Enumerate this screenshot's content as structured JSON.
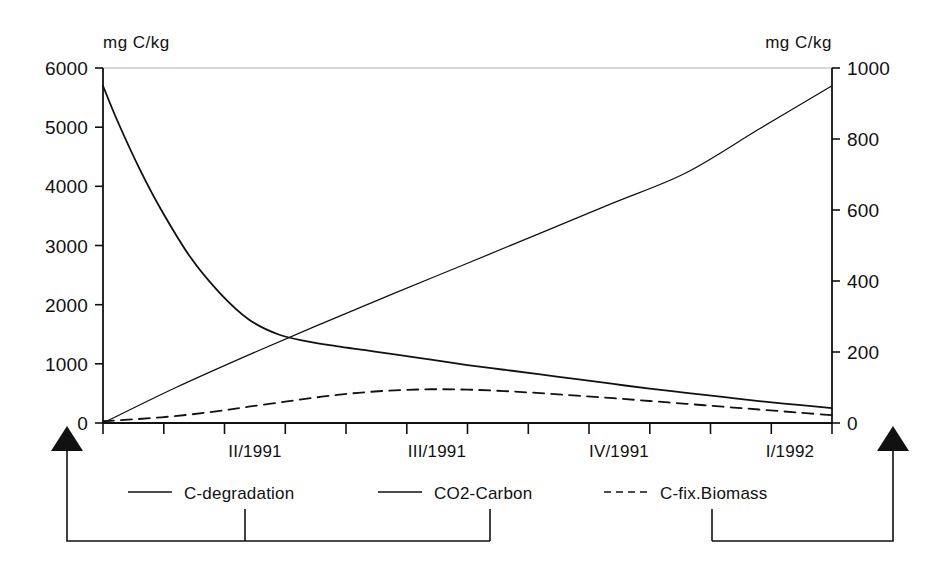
{
  "chart_data": {
    "type": "line",
    "title": "",
    "subtitle": "",
    "xlabel": "",
    "ylabel": "mg C/kg",
    "y2label": "mg C/kg",
    "grid": false,
    "legend_position": "bottom",
    "axes": {
      "left": {
        "unit": "mg C/kg",
        "ticks": [
          "0",
          "1000",
          "2000",
          "3000",
          "4000",
          "5000",
          "6000"
        ],
        "tick_values": [
          0,
          1000,
          2000,
          3000,
          4000,
          5000,
          6000
        ],
        "ylim": [
          0,
          6000
        ]
      },
      "right": {
        "unit": "mg C/kg",
        "ticks": [
          "0",
          "200",
          "400",
          "600",
          "800",
          "1000"
        ],
        "tick_values": [
          0,
          200,
          400,
          600,
          800,
          1000
        ],
        "ylim": [
          0,
          1000
        ]
      },
      "x": {
        "tick_labels": [
          "II/1991",
          "III/1991",
          "IV/1991",
          "I/1992"
        ],
        "tick_label_positions": [
          0.25,
          0.5,
          0.75,
          0.95
        ],
        "minor_tick_count": 11
      }
    },
    "series": [
      {
        "name": "C-degradation",
        "axis": "left",
        "style": "solid",
        "x": [
          0.0,
          0.02,
          0.05,
          0.08,
          0.12,
          0.16,
          0.2,
          0.24,
          0.28,
          0.32,
          0.36,
          0.4,
          0.45,
          0.5,
          0.55,
          0.6,
          0.65,
          0.7,
          0.75,
          0.8,
          0.85,
          0.9,
          0.95,
          1.0
        ],
        "values": [
          5700,
          5100,
          4300,
          3600,
          2800,
          2200,
          1750,
          1500,
          1380,
          1300,
          1230,
          1160,
          1070,
          980,
          900,
          820,
          740,
          660,
          580,
          510,
          440,
          370,
          310,
          250
        ]
      },
      {
        "name": "CO2-Carbon",
        "axis": "right",
        "style": "solid",
        "x": [
          0.0,
          0.1,
          0.2,
          0.3,
          0.4,
          0.5,
          0.6,
          0.7,
          0.8,
          0.9,
          1.0
        ],
        "values": [
          0,
          100,
          192,
          280,
          366,
          450,
          535,
          620,
          705,
          828,
          950
        ]
      },
      {
        "name": "C-fix.Biomass",
        "axis": "right",
        "style": "dashed",
        "x": [
          0.0,
          0.04,
          0.08,
          0.12,
          0.16,
          0.2,
          0.25,
          0.3,
          0.35,
          0.4,
          0.45,
          0.5,
          0.55,
          0.6,
          0.65,
          0.7,
          0.75,
          0.8,
          0.85,
          0.9,
          0.95,
          1.0
        ],
        "values": [
          5,
          10,
          16,
          24,
          34,
          46,
          60,
          74,
          85,
          92,
          95,
          94,
          90,
          84,
          77,
          70,
          62,
          54,
          46,
          38,
          30,
          22
        ]
      }
    ],
    "legend": [
      {
        "label": "C-degradation",
        "style": "solid"
      },
      {
        "label": "CO2-Carbon",
        "style": "solid"
      },
      {
        "label": "C-fix.Biomass",
        "style": "dashed"
      }
    ],
    "annotations": {
      "left_arrow": "arrow-up-left",
      "right_arrow": "arrow-up-right",
      "left_bracket_note": "C-degradation and CO2-Carbon map to left arrow (left axis region)",
      "right_bracket_note": "C-fix.Biomass maps to right arrow (right axis region)"
    }
  }
}
